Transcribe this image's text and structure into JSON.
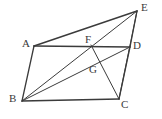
{
  "figure": {
    "type": "geometry-diagram",
    "width": 162,
    "height": 119,
    "background_color": "#ffffff",
    "stroke_color": "#3b3b3b",
    "label_color": "#3a3a3a"
  },
  "points": {
    "A": {
      "label": "A",
      "x": 34,
      "y": 46,
      "label_x": 22,
      "label_y": 38
    },
    "B": {
      "label": "B",
      "x": 22,
      "y": 101,
      "label_x": 9,
      "label_y": 93
    },
    "C": {
      "label": "C",
      "x": 119,
      "y": 99,
      "label_x": 121,
      "label_y": 99
    },
    "D": {
      "label": "D",
      "x": 130,
      "y": 47,
      "label_x": 133,
      "label_y": 40
    },
    "E": {
      "label": "E",
      "x": 137,
      "y": 11,
      "label_x": 141,
      "label_y": 2
    },
    "F": {
      "label": "F",
      "x": 91,
      "y": 45,
      "label_x": 85,
      "label_y": 34
    },
    "G": {
      "label": "G",
      "x": 96,
      "y": 63,
      "label_x": 89,
      "label_y": 64
    }
  },
  "segments": [
    {
      "name": "AB",
      "from": "A",
      "to": "B",
      "weight": 1.3
    },
    {
      "name": "BC",
      "from": "B",
      "to": "C",
      "weight": 1.3
    },
    {
      "name": "CD",
      "from": "C",
      "to": "D",
      "weight": 1.3
    },
    {
      "name": "AD",
      "from": "A",
      "to": "D",
      "weight": 1.3
    },
    {
      "name": "AE",
      "from": "A",
      "to": "E",
      "weight": 1.5
    },
    {
      "name": "BE",
      "from": "B",
      "to": "E",
      "weight": 1.0
    },
    {
      "name": "ED",
      "from": "E",
      "to": "D",
      "weight": 1.3
    },
    {
      "name": "EC",
      "from": "E",
      "to": "C",
      "weight": 1.0
    },
    {
      "name": "BD",
      "from": "B",
      "to": "D",
      "weight": 1.0
    },
    {
      "name": "FC",
      "from": "F",
      "to": "C",
      "weight": 1.0
    }
  ],
  "labels": {
    "A": "A",
    "B": "B",
    "C": "C",
    "D": "D",
    "E": "E",
    "F": "F",
    "G": "G"
  }
}
